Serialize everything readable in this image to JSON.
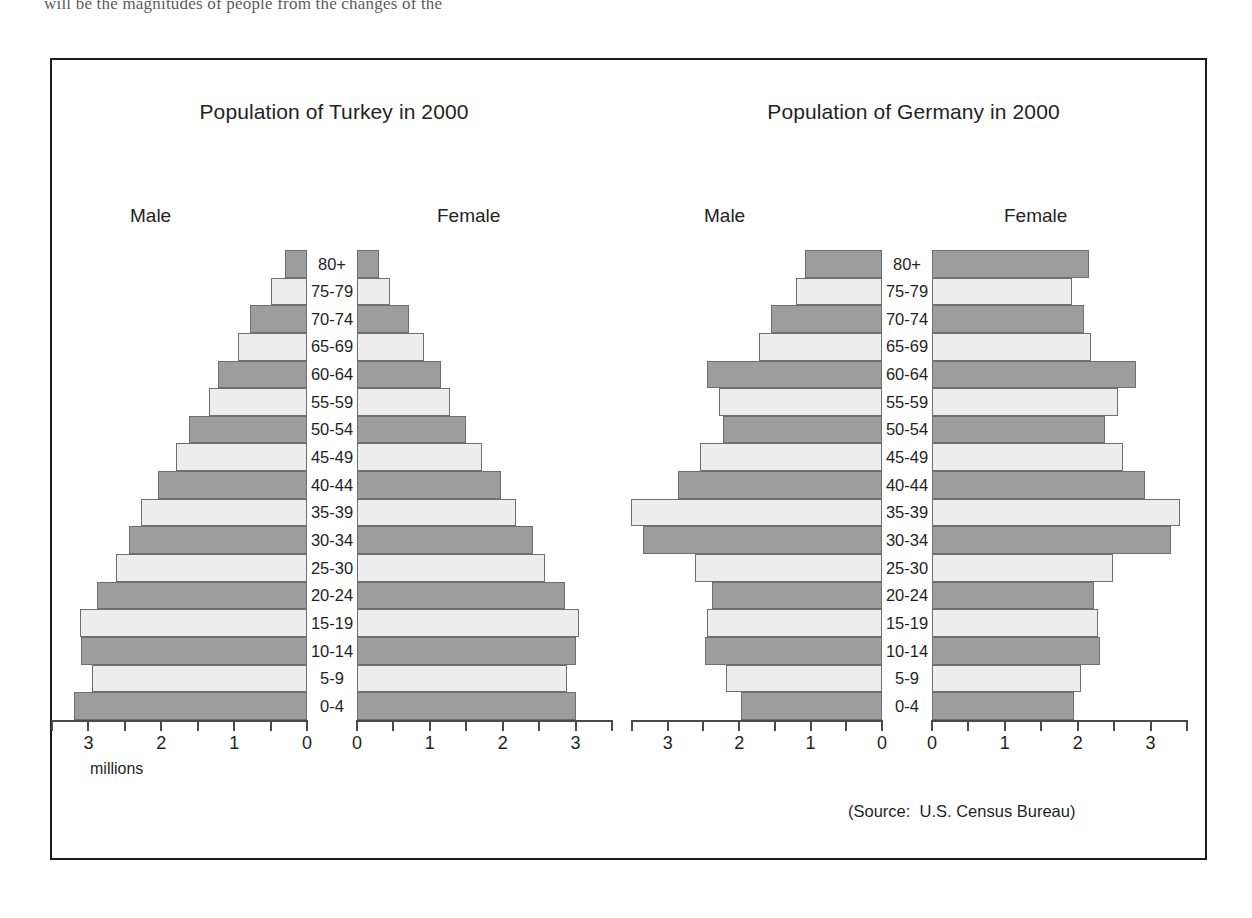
{
  "page": {
    "partial_top_line": "will be the magnitudes of people from the changes of the"
  },
  "source_note": "(Source:  U.S. Census Bureau)",
  "axis_unit_label": "millions",
  "colors": {
    "bar_dark": "#9d9d9d",
    "bar_light": "#ededed",
    "bar_border": "#6f6f6f",
    "frame": "#1c1c1c",
    "text": "#1f1f1f"
  },
  "age_groups": [
    "80+",
    "75-79",
    "70-74",
    "65-69",
    "60-64",
    "55-59",
    "50-54",
    "45-49",
    "40-44",
    "35-39",
    "30-34",
    "25-30",
    "20-24",
    "15-19",
    "10-14",
    "5-9",
    "0-4"
  ],
  "sex_labels": {
    "male": "Male",
    "female": "Female"
  },
  "charts": [
    {
      "id": "turkey",
      "title": "Population of Turkey in 2000"
    },
    {
      "id": "germany",
      "title": "Population of Germany in 2000"
    }
  ],
  "chart_data": [
    {
      "type": "bar",
      "subtype": "population-pyramid",
      "title": "Population of Turkey in 2000",
      "xlabel": "millions",
      "ylabel": "",
      "categories": [
        "80+",
        "75-79",
        "70-74",
        "65-69",
        "60-64",
        "55-59",
        "50-54",
        "45-49",
        "40-44",
        "35-39",
        "30-34",
        "25-30",
        "20-24",
        "15-19",
        "10-14",
        "5-9",
        "0-4"
      ],
      "series": [
        {
          "name": "Male",
          "side": "left",
          "values": [
            0.3,
            0.5,
            0.78,
            0.95,
            1.22,
            1.35,
            1.62,
            1.8,
            2.05,
            2.28,
            2.45,
            2.62,
            2.88,
            3.12,
            3.1,
            2.95,
            3.2
          ]
        },
        {
          "name": "Female",
          "side": "right",
          "values": [
            0.3,
            0.45,
            0.72,
            0.92,
            1.15,
            1.28,
            1.5,
            1.72,
            1.98,
            2.18,
            2.42,
            2.58,
            2.85,
            3.05,
            3.0,
            2.88,
            3.0
          ]
        }
      ],
      "xlim": [
        0,
        3.5
      ],
      "xticks": [
        0,
        0.5,
        1,
        1.5,
        2,
        2.5,
        3,
        3.5
      ],
      "xticklabels": [
        "0",
        "",
        "1",
        "",
        "2",
        "",
        "3",
        ""
      ],
      "grid": false,
      "legend": "none"
    },
    {
      "type": "bar",
      "subtype": "population-pyramid",
      "title": "Population of Germany in 2000",
      "xlabel": "",
      "ylabel": "",
      "categories": [
        "80+",
        "75-79",
        "70-74",
        "65-69",
        "60-64",
        "55-59",
        "50-54",
        "45-49",
        "40-44",
        "35-39",
        "30-34",
        "25-30",
        "20-24",
        "15-19",
        "10-14",
        "5-9",
        "0-4"
      ],
      "series": [
        {
          "name": "Male",
          "side": "left",
          "values": [
            1.08,
            1.2,
            1.55,
            1.72,
            2.45,
            2.28,
            2.22,
            2.55,
            2.85,
            3.52,
            3.35,
            2.62,
            2.38,
            2.45,
            2.48,
            2.18,
            1.98
          ]
        },
        {
          "name": "Female",
          "side": "right",
          "values": [
            2.15,
            1.92,
            2.08,
            2.18,
            2.8,
            2.55,
            2.38,
            2.62,
            2.92,
            3.4,
            3.28,
            2.48,
            2.22,
            2.28,
            2.3,
            2.05,
            1.95
          ]
        }
      ],
      "xlim": [
        0,
        3.5
      ],
      "xticks": [
        0,
        0.5,
        1,
        1.5,
        2,
        2.5,
        3,
        3.5
      ],
      "xticklabels": [
        "0",
        "",
        "1",
        "",
        "2",
        "",
        "3",
        ""
      ],
      "grid": false,
      "legend": "none"
    }
  ]
}
